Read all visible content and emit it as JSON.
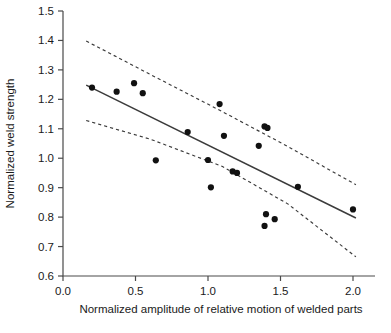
{
  "chart_data": {
    "type": "scatter",
    "title": "",
    "subtitle": "",
    "xlabel": "Normalized amplitude of relative motion of welded parts",
    "ylabel": "Normalized weld strength",
    "xlim": [
      0.0,
      2.15
    ],
    "ylim": [
      0.6,
      1.5
    ],
    "xticks": [
      0.0,
      0.5,
      1.0,
      1.5,
      2.0
    ],
    "xtick_labels": [
      "0.0",
      "0.5",
      "1.0",
      "1.5",
      "2.0"
    ],
    "yticks": [
      0.6,
      0.7,
      0.8,
      0.9,
      1.0,
      1.1,
      1.2,
      1.3,
      1.4,
      1.5
    ],
    "ytick_labels": [
      "0.6",
      "0.7",
      "0.8",
      "0.9",
      "1.0",
      "1.1",
      "1.2",
      "1.3",
      "1.4",
      "1.5"
    ],
    "grid": false,
    "legend": null,
    "legend_position": "none",
    "marker": "filled-circle",
    "marker_color": "#111111",
    "points": [
      {
        "x": 0.2,
        "y": 1.24
      },
      {
        "x": 0.37,
        "y": 1.226
      },
      {
        "x": 0.49,
        "y": 1.255
      },
      {
        "x": 0.55,
        "y": 1.221
      },
      {
        "x": 0.64,
        "y": 0.993
      },
      {
        "x": 0.86,
        "y": 1.089
      },
      {
        "x": 1.0,
        "y": 0.994
      },
      {
        "x": 1.02,
        "y": 0.901
      },
      {
        "x": 1.08,
        "y": 1.184
      },
      {
        "x": 1.11,
        "y": 1.076
      },
      {
        "x": 1.17,
        "y": 0.955
      },
      {
        "x": 1.2,
        "y": 0.95
      },
      {
        "x": 1.35,
        "y": 1.042
      },
      {
        "x": 1.39,
        "y": 1.108
      },
      {
        "x": 1.41,
        "y": 1.103
      },
      {
        "x": 1.39,
        "y": 0.77
      },
      {
        "x": 1.4,
        "y": 0.81
      },
      {
        "x": 1.46,
        "y": 0.793
      },
      {
        "x": 1.62,
        "y": 0.903
      },
      {
        "x": 2.0,
        "y": 0.826
      }
    ],
    "series": [
      {
        "name": "regression-fit",
        "style": "solid",
        "x": [
          0.16,
          2.02
        ],
        "y": [
          1.248,
          0.797
        ]
      },
      {
        "name": "upper-confidence-band",
        "style": "dashed",
        "x": [
          0.16,
          0.6,
          1.1,
          1.55,
          2.02
        ],
        "y": [
          1.398,
          1.285,
          1.158,
          1.04,
          0.91
        ]
      },
      {
        "name": "lower-confidence-band",
        "style": "dashed",
        "x": [
          0.16,
          0.6,
          1.1,
          1.55,
          2.02
        ],
        "y": [
          1.128,
          1.065,
          0.972,
          0.845,
          0.665
        ]
      }
    ],
    "axis_color": "#4a4a4a",
    "line_color": "#3b3b3b"
  }
}
